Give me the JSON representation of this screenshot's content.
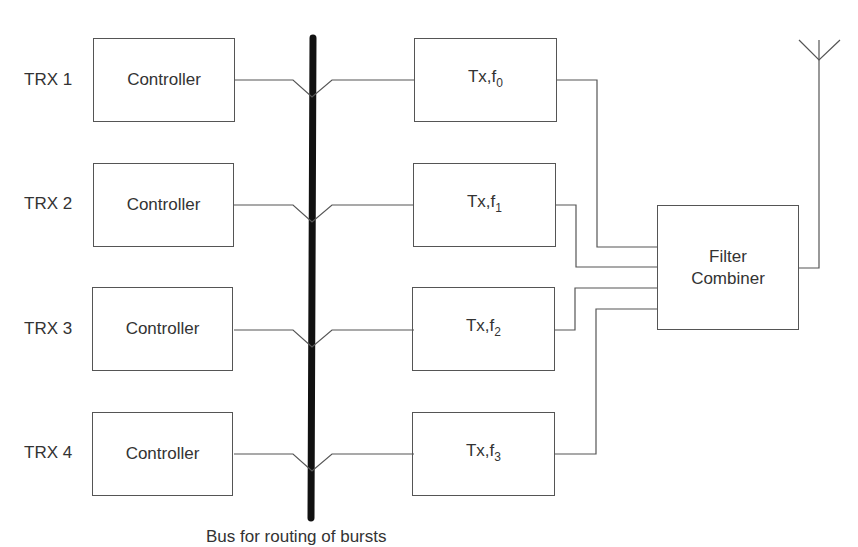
{
  "diagram": {
    "trx_labels": [
      "TRX 1",
      "TRX 2",
      "TRX 3",
      "TRX 4"
    ],
    "controllers": [
      "Controller",
      "Controller",
      "Controller",
      "Controller"
    ],
    "transmitters": [
      {
        "main": "Tx,f",
        "sub": "0"
      },
      {
        "main": "Tx,f",
        "sub": "1"
      },
      {
        "main": "Tx,f",
        "sub": "2"
      },
      {
        "main": "Tx,f",
        "sub": "3"
      }
    ],
    "combiner": {
      "line1": "Filter",
      "line2": "Combiner"
    },
    "bus_caption": "Bus for routing of bursts",
    "antenna": "antenna-icon",
    "colors": {
      "line": "#555555",
      "bus": "#111111",
      "text": "#333333"
    }
  }
}
